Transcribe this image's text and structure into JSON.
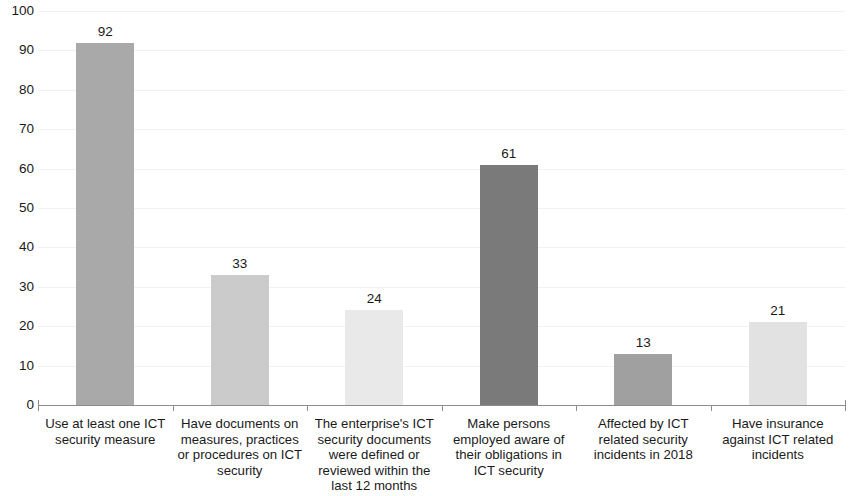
{
  "chart_data": {
    "type": "bar",
    "title": "",
    "subtitle": "",
    "xlabel": "",
    "ylabel": "",
    "ylim": [
      0,
      100
    ],
    "y_ticks": [
      0,
      10,
      20,
      30,
      40,
      50,
      60,
      70,
      80,
      90,
      100
    ],
    "y_tick_labels": [
      "0",
      "10",
      "20",
      "30",
      "40",
      "50",
      "60",
      "70",
      "80",
      "90",
      "100"
    ],
    "grid": true,
    "legend": false,
    "legend_position": "none",
    "categories": [
      "Use at least one ICT security measure",
      "Have documents on measures, practices or procedures on ICT security",
      "The enterprise's ICT security documents were defined or reviewed within the last 12 months",
      "Make persons employed aware of their obligations in ICT security",
      "Affected by ICT related security incidents in 2018",
      "Have insurance against ICT related incidents"
    ],
    "category_lines": [
      [
        "Use at least one ICT",
        "security measure"
      ],
      [
        "Have documents on",
        "measures, practices",
        "or procedures on ICT",
        "security"
      ],
      [
        "The enterprise's ICT",
        "security documents",
        "were defined or",
        "reviewed within the",
        "last 12 months"
      ],
      [
        "Make persons",
        "employed aware of",
        "their obligations in",
        "ICT security"
      ],
      [
        "Affected by ICT",
        "related security",
        "incidents in 2018"
      ],
      [
        "Have insurance",
        "against ICT related",
        "incidents"
      ]
    ],
    "values": [
      92,
      33,
      24,
      61,
      13,
      21
    ],
    "value_labels": [
      "92",
      "33",
      "24",
      "61",
      "13",
      "21"
    ],
    "bar_colors": [
      "#a9a9a9",
      "#cbcbcb",
      "#e9e9e9",
      "#7a7a7a",
      "#a0a0a0",
      "#e2e2e2"
    ],
    "axis_color": "#8c8c8c",
    "grid_color": "#f2f2f2",
    "text_color": "#1a1a1a",
    "background_color": "#ffffff"
  }
}
